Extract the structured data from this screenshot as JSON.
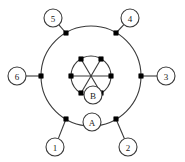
{
  "figure": {
    "type": "concentric-network-diagram",
    "background": "#ffffff",
    "line_color": "#3a3a3a",
    "node_color": "#000000",
    "label_text_color": "#1a1a1a",
    "center": {
      "x": 91,
      "y": 76
    },
    "outer_circle": {
      "radius": 50,
      "node_count": 6
    },
    "inner_circle": {
      "radius": 20,
      "node_count": 6
    },
    "chord_lines": 3
  },
  "terminal_labels": [
    {
      "id": "terminal-1",
      "text": "1",
      "cx": 55,
      "cy": 147,
      "r": 9,
      "angle_deg": 240
    },
    {
      "id": "terminal-2",
      "text": "2",
      "cx": 128,
      "cy": 147,
      "r": 9,
      "angle_deg": 300
    },
    {
      "id": "terminal-3",
      "text": "3",
      "cx": 166,
      "cy": 76,
      "r": 9,
      "angle_deg": 0
    },
    {
      "id": "terminal-4",
      "text": "4",
      "cx": 130,
      "cy": 18,
      "r": 9,
      "angle_deg": 60
    },
    {
      "id": "terminal-5",
      "text": "5",
      "cx": 53,
      "cy": 18,
      "r": 9,
      "angle_deg": 120
    },
    {
      "id": "terminal-6",
      "text": "6",
      "cx": 17,
      "cy": 76,
      "r": 9,
      "angle_deg": 180
    }
  ],
  "region_labels": [
    {
      "id": "region-A",
      "text": "A",
      "cx": 92,
      "cy": 122,
      "r": 9
    },
    {
      "id": "region-B",
      "text": "B",
      "cx": 93,
      "cy": 95,
      "r": 9
    }
  ],
  "outer_nodes": [
    {
      "id": "outer-node-1",
      "x": 66,
      "y": 119,
      "angle_deg": 240
    },
    {
      "id": "outer-node-2",
      "x": 116,
      "y": 119,
      "angle_deg": 300
    },
    {
      "id": "outer-node-3",
      "x": 141,
      "y": 76,
      "angle_deg": 0
    },
    {
      "id": "outer-node-4",
      "x": 116,
      "y": 33,
      "angle_deg": 60
    },
    {
      "id": "outer-node-5",
      "x": 66,
      "y": 33,
      "angle_deg": 120
    },
    {
      "id": "outer-node-6",
      "x": 41,
      "y": 76,
      "angle_deg": 180
    }
  ],
  "inner_nodes": [
    {
      "id": "inner-node-1",
      "x": 81,
      "y": 93,
      "angle_deg": 240
    },
    {
      "id": "inner-node-2",
      "x": 101,
      "y": 93,
      "angle_deg": 300
    },
    {
      "id": "inner-node-3",
      "x": 111,
      "y": 76,
      "angle_deg": 0
    },
    {
      "id": "inner-node-4",
      "x": 101,
      "y": 59,
      "angle_deg": 60
    },
    {
      "id": "inner-node-5",
      "x": 81,
      "y": 59,
      "angle_deg": 120
    },
    {
      "id": "inner-node-6",
      "x": 71,
      "y": 76,
      "angle_deg": 180
    }
  ]
}
